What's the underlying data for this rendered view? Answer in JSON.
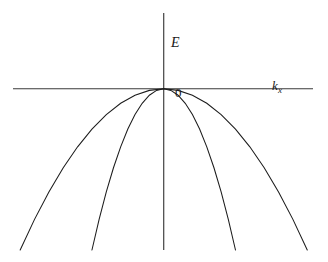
{
  "figure": {
    "title": "",
    "background_color": "#ffffff",
    "axis_color": "#3a3a3a",
    "curve_color": "#1c1c1c",
    "width": 328,
    "height": 262
  },
  "labels": {
    "y_axis": "E",
    "x_axis_symbol": "k",
    "x_axis_subscript": "x",
    "origin": "0"
  },
  "chart_data": {
    "type": "line",
    "title": "",
    "xlabel": "k_x",
    "ylabel": "E",
    "grid": false,
    "legend": null,
    "annotations": [
      {
        "text": "E",
        "x": 0.0,
        "y": 0.72,
        "role": "y-axis-label"
      },
      {
        "text": "0",
        "x": 0.05,
        "y": -0.08,
        "role": "origin-label"
      },
      {
        "text": "k_x",
        "x": 0.75,
        "y": -0.04,
        "role": "x-axis-label"
      }
    ],
    "axes": {
      "x_axis_y_value": 0,
      "y_axis_x_value": 0,
      "xlim": [
        -1.05,
        1.04
      ],
      "ylim": [
        -1.0,
        0.47
      ],
      "x_axis_drawn_from": -1.05,
      "x_axis_drawn_to": 1.04,
      "y_axis_drawn_from": -1.0,
      "y_axis_drawn_to": 0.47
    },
    "series": [
      {
        "name": "outer band (wide parabola, small curvature)",
        "form": "E = -a*k^2",
        "curvature_a": 1.0,
        "vertex": [
          0,
          0
        ],
        "x": [
          -1.0,
          -0.9,
          -0.8,
          -0.7,
          -0.6,
          -0.5,
          -0.4,
          -0.3,
          -0.2,
          -0.1,
          0.0,
          0.1,
          0.2,
          0.3,
          0.4,
          0.5,
          0.6,
          0.7,
          0.8,
          0.9,
          1.0
        ],
        "values": [
          -1.0,
          -0.81,
          -0.64,
          -0.49,
          -0.36,
          -0.25,
          -0.16,
          -0.09,
          -0.04,
          -0.01,
          0.0,
          -0.01,
          -0.04,
          -0.09,
          -0.16,
          -0.25,
          -0.36,
          -0.49,
          -0.64,
          -0.81,
          -1.0
        ]
      },
      {
        "name": "inner band (narrow parabola, large curvature)",
        "form": "E = -a*k^2",
        "curvature_a": 4.0,
        "vertex": [
          0,
          0
        ],
        "x": [
          -0.5,
          -0.45,
          -0.4,
          -0.35,
          -0.3,
          -0.25,
          -0.2,
          -0.15,
          -0.1,
          -0.05,
          0.0,
          0.05,
          0.1,
          0.15,
          0.2,
          0.25,
          0.3,
          0.35,
          0.4,
          0.45,
          0.5
        ],
        "values": [
          -1.0,
          -0.81,
          -0.64,
          -0.49,
          -0.36,
          -0.25,
          -0.16,
          -0.09,
          -0.04,
          -0.01,
          0.0,
          -0.01,
          -0.04,
          -0.09,
          -0.16,
          -0.25,
          -0.36,
          -0.49,
          -0.64,
          -0.81,
          -1.0
        ]
      }
    ]
  }
}
